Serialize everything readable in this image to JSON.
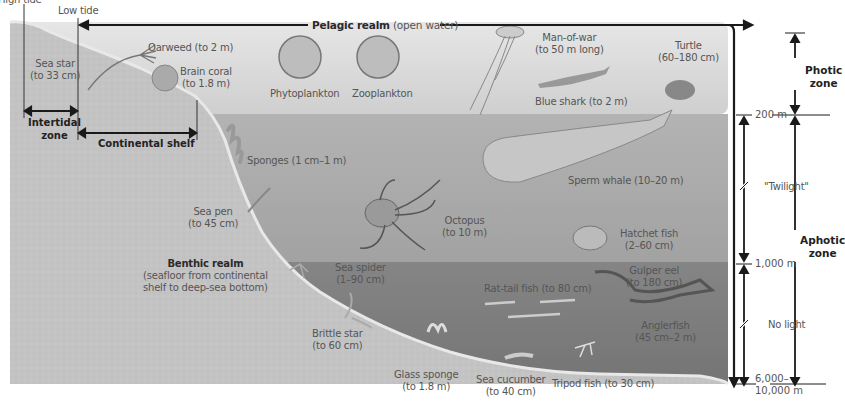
{
  "diagram": {
    "realms": {
      "pelagic": {
        "name": "Pelagic realm",
        "desc": "(open water)"
      },
      "benthic": {
        "name": "Benthic realm",
        "desc_line1": "(seafloor from continental",
        "desc_line2": "shelf to deep-sea bottom)"
      }
    },
    "tide_labels": {
      "high": "High tide",
      "low": "Low tide"
    },
    "shore_zones": {
      "intertidal_line1": "Intertidal",
      "intertidal_line2": "zone",
      "continental_shelf": "Continental shelf"
    },
    "depth_zones": {
      "photic_line1": "Photic",
      "photic_line2": "zone",
      "aphotic_line1": "Aphotic",
      "aphotic_line2": "zone",
      "twilight": "\"Twilight\"",
      "no_light": "No light"
    },
    "depth_ticks": {
      "d200": "200 m",
      "d1000": "1,000 m",
      "d_bottom_line1": "6,000–",
      "d_bottom_line2": "10,000 m"
    },
    "organisms": [
      {
        "name": "Sea star",
        "size": "(to 33 cm)"
      },
      {
        "name": "Oarweed (to 2 m)"
      },
      {
        "name": "Brain coral",
        "size": "(to 1.8 m)"
      },
      {
        "name": "Phytoplankton"
      },
      {
        "name": "Zooplankton"
      },
      {
        "name": "Man-of-war",
        "size": "(to 50 m long)"
      },
      {
        "name": "Turtle",
        "size": "(60–180 cm)"
      },
      {
        "name": "Blue shark (to 2 m)"
      },
      {
        "name": "Sponges (1 cm–1 m)"
      },
      {
        "name": "Sperm whale (10–20 m)"
      },
      {
        "name": "Sea pen",
        "size": "(to 45 cm)"
      },
      {
        "name": "Octopus",
        "size": "(to 10 m)"
      },
      {
        "name": "Hatchet fish",
        "size": "(2–60 cm)"
      },
      {
        "name": "Sea spider",
        "size": "(1–90 cm)"
      },
      {
        "name": "Gulper eel",
        "size": "(to 180 cm)"
      },
      {
        "name": "Rat-tail fish (to 80 cm)"
      },
      {
        "name": "Brittle star",
        "size": "(to 60 cm)"
      },
      {
        "name": "Anglerfish",
        "size": "(45 cm–2 m)"
      },
      {
        "name": "Glass sponge",
        "size": "(to 1.8 m)"
      },
      {
        "name": "Sea cucumber",
        "size": "(to 40 cm)"
      },
      {
        "name": "Tripod fish (to 30 cm)"
      }
    ],
    "colors": {
      "photic_water": "#d8d8d8",
      "twilight_water": "#a9a9a9",
      "dark_water": "#7c7c7c",
      "seafloor": "#c4c4c4",
      "arrow": "#1a1a1a"
    }
  }
}
